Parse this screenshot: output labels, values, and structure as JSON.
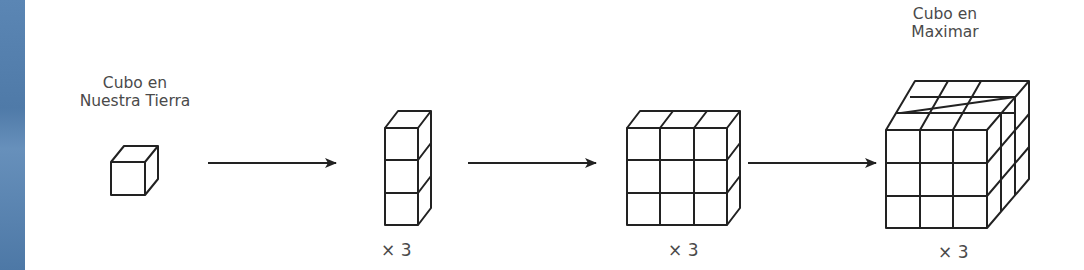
{
  "diagram": {
    "stages": [
      {
        "id": "single",
        "label_line1": "Cubo en",
        "label_line2": "Nuestra Tierra",
        "grid": [
          1,
          1,
          1
        ]
      },
      {
        "id": "column",
        "multiplier": "× 3",
        "grid": [
          1,
          3,
          1
        ]
      },
      {
        "id": "wall",
        "multiplier": "× 3",
        "grid": [
          3,
          3,
          1
        ]
      },
      {
        "id": "cube",
        "label_line1": "Cubo en",
        "label_line2": "Maximar",
        "multiplier": "× 3",
        "grid": [
          3,
          3,
          3
        ]
      }
    ],
    "arrows": 3,
    "colors": {
      "stroke": "#222222",
      "text": "#4a4a4a",
      "edge": "#5b86b4"
    }
  }
}
